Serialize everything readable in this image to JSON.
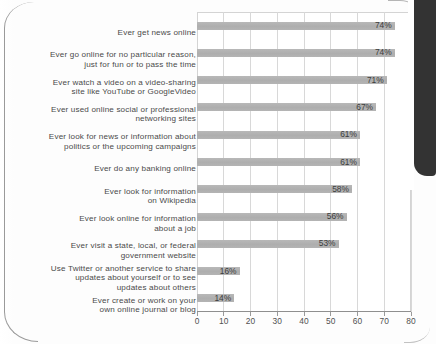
{
  "chart_data": {
    "type": "bar",
    "orientation": "horizontal",
    "title": "",
    "subtitle": "",
    "xlabel": "",
    "ylabel": "",
    "xlim": [
      0,
      80
    ],
    "xticks": [
      0,
      10,
      20,
      30,
      40,
      50,
      60,
      70,
      80
    ],
    "xtick_labels": [
      "0",
      "10",
      "20",
      "30",
      "40",
      "50",
      "60",
      "70",
      "80"
    ],
    "grid": "vertical",
    "legend": "none",
    "value_label_suffix": "%",
    "bar_color": "#b2b2b2",
    "categories": [
      "Ever get news online",
      "Ever go online for no particular reason,\njust for fun or to pass the time",
      "Ever watch a video on a video-sharing\nsite like YouTube or GoogleVideo",
      "Ever used online social or professional\nnetworking sites",
      "Ever look for news or information about\npolitics or the upcoming campaigns",
      "Ever do any banking online",
      "Ever look for information\non Wikipedia",
      "Ever look online for information\nabout a job",
      "Ever visit a state, local, or federal\ngovernment website",
      "Use Twitter or another service to share\nupdates about yourself or to see\nupdates about others",
      "Ever create or work on your\nown online journal or blog"
    ],
    "values": [
      74,
      74,
      71,
      67,
      61,
      61,
      58,
      56,
      53,
      16,
      14
    ],
    "value_labels": [
      "74%",
      "74%",
      "71%",
      "67%",
      "61%",
      "61%",
      "58%",
      "56%",
      "53%",
      "16%",
      "14%"
    ]
  }
}
